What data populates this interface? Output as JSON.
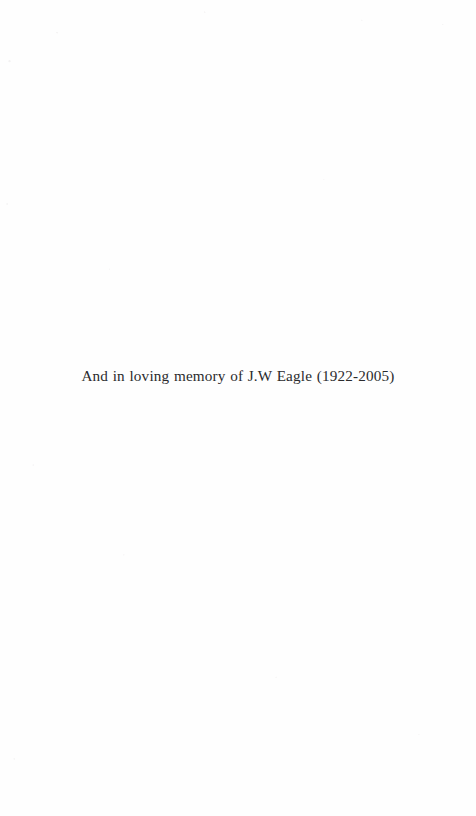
{
  "page": {
    "kind": "book-dedication-page",
    "background_color": "#fefefe",
    "text_color": "#2b2b2d",
    "width": 476,
    "height": 816
  },
  "dedication": {
    "text": "And in loving memory of J.W Eagle (1922-2005)",
    "name": "J.W Eagle",
    "birth_year": "1922",
    "death_year": "2005",
    "years": "(1922-2005)"
  }
}
